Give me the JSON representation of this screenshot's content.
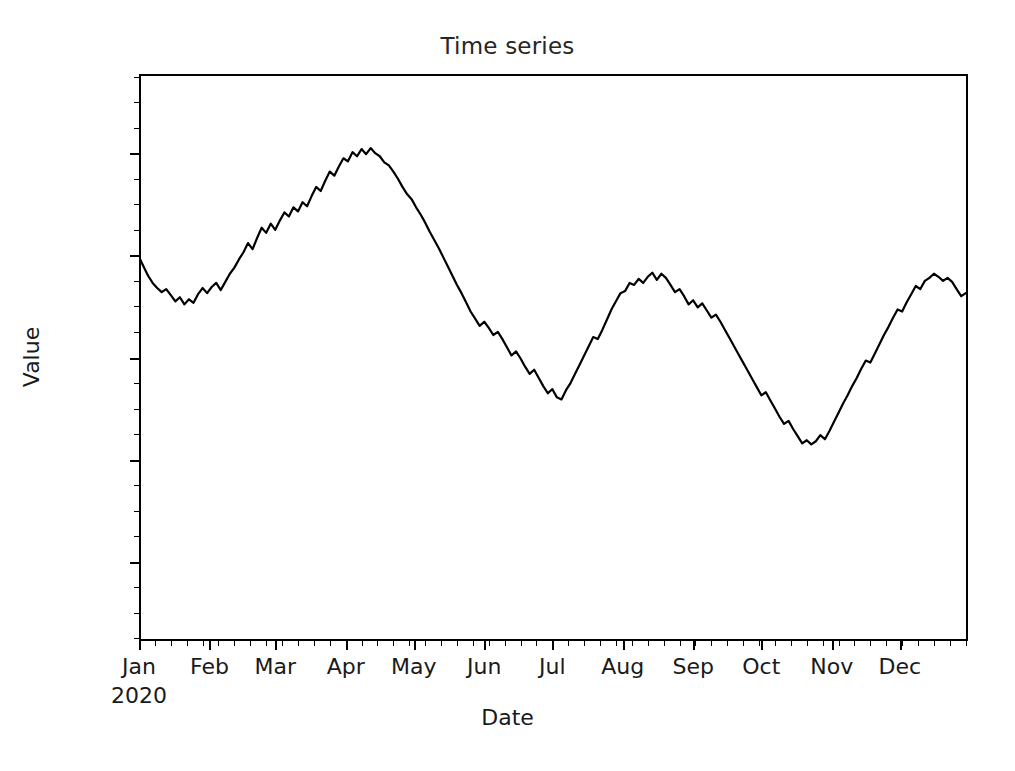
{
  "figure": {
    "width": 1015,
    "height": 771,
    "background": "#ffffff"
  },
  "chart_data": {
    "type": "line",
    "title": "Time series",
    "xlabel": "Date",
    "ylabel": "Value",
    "grid": false,
    "legend": null,
    "line_color": "#000000",
    "line_width": 2.2,
    "x_axis": {
      "type": "date",
      "range": [
        "2020-01-01",
        "2020-12-31"
      ],
      "major_tick_labels": [
        "Jan",
        "Feb",
        "Mar",
        "Apr",
        "May",
        "Jun",
        "Jul",
        "Aug",
        "Sep",
        "Oct",
        "Nov",
        "Dec"
      ],
      "major_tick_sublabels": [
        "2020",
        "",
        "",
        "",
        "",
        "",
        "",
        "",
        "",
        "",
        "",
        ""
      ],
      "major_tick_positions": [
        0,
        31,
        60,
        91,
        121,
        152,
        182,
        213,
        244,
        274,
        305,
        335
      ],
      "minor_tick_interval_days": 7
    },
    "y_axis": {
      "tick_labels": [
        "20",
        "0",
        "−20",
        "−40",
        "−60"
      ],
      "tick_values": [
        20,
        0,
        -20,
        -40,
        -60
      ],
      "ylim": [
        -75.5,
        35.5
      ]
    },
    "series": [
      {
        "name": "value",
        "x_days": [
          0,
          2,
          4,
          6,
          8,
          10,
          12,
          14,
          16,
          18,
          20,
          22,
          24,
          26,
          28,
          30,
          32,
          34,
          36,
          38,
          40,
          42,
          44,
          46,
          48,
          50,
          52,
          54,
          56,
          58,
          60,
          62,
          64,
          66,
          68,
          70,
          72,
          74,
          76,
          78,
          80,
          82,
          84,
          86,
          88,
          90,
          92,
          94,
          96,
          98,
          100,
          102,
          104,
          106,
          108,
          110,
          112,
          114,
          116,
          118,
          120,
          122,
          124,
          126,
          128,
          130,
          132,
          134,
          136,
          138,
          140,
          142,
          144,
          146,
          148,
          150,
          152,
          154,
          156,
          158,
          160,
          162,
          164,
          166,
          168,
          170,
          172,
          174,
          176,
          178,
          180,
          182,
          184,
          186,
          188,
          190,
          192,
          194,
          196,
          198,
          200,
          202,
          204,
          206,
          208,
          210,
          212,
          214,
          216,
          218,
          220,
          222,
          224,
          226,
          228,
          230,
          232,
          234,
          236,
          238,
          240,
          242,
          244,
          246,
          248,
          250,
          252,
          254,
          256,
          258,
          260,
          262,
          264,
          266,
          268,
          270,
          272,
          274,
          276,
          278,
          280,
          282,
          284,
          286,
          288,
          290,
          292,
          294,
          296,
          298,
          300,
          302,
          304,
          306,
          308,
          310,
          312,
          314,
          316,
          318,
          320,
          322,
          324,
          326,
          328,
          330,
          332,
          334,
          336,
          338,
          340,
          342,
          344,
          346,
          348,
          350,
          352,
          354,
          356,
          358,
          360,
          362,
          364
        ],
        "values": [
          -0.3,
          -2.2,
          -4.0,
          -5.4,
          -6.4,
          -7.2,
          -6.6,
          -7.8,
          -9.0,
          -8.2,
          -9.6,
          -8.6,
          -9.3,
          -7.6,
          -6.4,
          -7.4,
          -6.2,
          -5.4,
          -6.8,
          -5.2,
          -3.6,
          -2.4,
          -0.8,
          0.6,
          2.4,
          1.2,
          3.4,
          5.4,
          4.4,
          6.2,
          5.0,
          6.8,
          8.4,
          7.6,
          9.4,
          8.6,
          10.4,
          9.6,
          11.6,
          13.4,
          12.6,
          14.6,
          16.4,
          15.6,
          17.4,
          19.0,
          18.4,
          20.2,
          19.4,
          20.8,
          19.8,
          21.0,
          20.0,
          19.4,
          18.2,
          17.6,
          16.4,
          15.0,
          13.4,
          12.0,
          11.0,
          9.4,
          8.0,
          6.4,
          4.6,
          3.0,
          1.4,
          -0.4,
          -2.2,
          -4.0,
          -5.8,
          -7.4,
          -9.2,
          -11.0,
          -12.4,
          -13.8,
          -13.0,
          -14.2,
          -15.6,
          -15.0,
          -16.4,
          -18.0,
          -19.6,
          -18.8,
          -20.2,
          -21.8,
          -23.2,
          -22.4,
          -24.0,
          -25.6,
          -27.0,
          -26.2,
          -27.8,
          -28.2,
          -26.4,
          -25.0,
          -23.2,
          -21.4,
          -19.6,
          -17.8,
          -16.0,
          -16.4,
          -14.6,
          -12.6,
          -10.6,
          -9.0,
          -7.4,
          -7.0,
          -5.4,
          -5.8,
          -4.6,
          -5.4,
          -4.2,
          -3.4,
          -4.8,
          -3.6,
          -4.4,
          -5.8,
          -7.2,
          -6.6,
          -8.0,
          -9.6,
          -8.8,
          -10.2,
          -9.4,
          -10.8,
          -12.2,
          -11.6,
          -13.0,
          -14.6,
          -16.2,
          -17.8,
          -19.4,
          -21.0,
          -22.6,
          -24.2,
          -25.8,
          -27.4,
          -26.8,
          -28.4,
          -30.0,
          -31.6,
          -33.0,
          -32.4,
          -34.0,
          -35.4,
          -36.8,
          -36.2,
          -37.0,
          -36.4,
          -35.2,
          -36.0,
          -34.4,
          -32.6,
          -30.8,
          -29.0,
          -27.4,
          -25.6,
          -24.0,
          -22.2,
          -20.6,
          -21.0,
          -19.2,
          -17.4,
          -15.6,
          -14.0,
          -12.2,
          -10.6,
          -11.0,
          -9.2,
          -7.6,
          -6.0,
          -6.6,
          -5.0,
          -4.4,
          -3.6,
          -4.2,
          -5.0,
          -4.4,
          -5.2,
          -6.6,
          -8.0,
          -7.4,
          -8.8,
          -10.2,
          -11.6,
          -13.0,
          -12.4,
          -13.8,
          -15.2,
          -14.2,
          -15.6,
          -17.0,
          -16.2,
          -17.6,
          -19.0,
          -19.8,
          -18.2,
          -16.4,
          -14.6,
          -12.8,
          -11.0,
          -9.2,
          -7.4,
          -5.6,
          -3.8,
          -2.0,
          -0.2,
          1.6,
          3.4,
          5.2,
          7.0,
          8.8,
          10.6,
          12.4,
          14.2,
          16.0,
          15.2,
          16.8,
          15.6,
          17.0,
          16.2,
          17.4,
          16.6,
          18.0,
          19.6,
          21.2,
          20.4,
          22.0,
          23.6,
          22.8,
          24.4,
          23.4,
          25.0,
          26.6,
          25.6,
          27.2,
          28.6,
          27.8,
          29.2,
          30.2,
          29.4,
          28.0,
          29.6,
          28.4,
          27.0,
          25.4,
          26.2,
          24.6,
          23.0,
          21.4,
          20.0,
          18.4,
          17.0,
          15.4,
          14.0,
          12.4,
          11.0,
          9.4,
          7.0,
          4.4,
          1.8,
          -0.8,
          -3.4,
          -6.0,
          -8.6,
          -11.2,
          -13.8,
          -16.4,
          -19.0,
          -21.6,
          -24.2,
          -26.8,
          -29.4,
          -32.0,
          -34.6,
          -37.2,
          -39.8,
          -42.4,
          -45.0,
          -47.6,
          -50.2,
          -52.4,
          -54.6,
          -56.6,
          -58.4,
          -60.2,
          -62.0,
          -63.6,
          -65.0,
          -66.4,
          -67.6,
          -68.4,
          -69.2,
          -68.6,
          -69.8,
          -70.6,
          -71.0,
          -70.2,
          -71.4,
          -70.6,
          -69.4,
          -70.4,
          -68.6,
          -70.0,
          -71.2,
          -70.0,
          -68.4,
          -67.0,
          -66.0,
          -64.4,
          -65.2,
          -63.6,
          -62.0,
          -60.4,
          -58.8,
          -57.2,
          -55.6,
          -54.2
        ]
      }
    ],
    "annotations": []
  }
}
